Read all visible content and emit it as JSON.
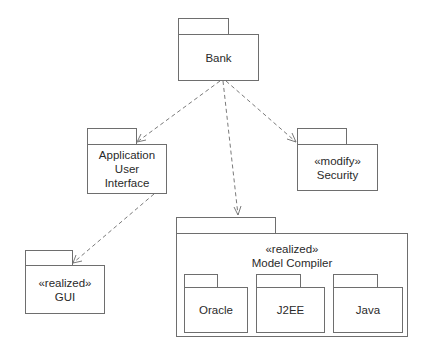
{
  "diagram": {
    "type": "UML package diagram",
    "packages": [
      {
        "id": "bank",
        "stereotype": "",
        "name_lines": [
          "Bank"
        ]
      },
      {
        "id": "app_ui",
        "stereotype": "",
        "name_lines": [
          "Application",
          "User",
          "Interface"
        ]
      },
      {
        "id": "security",
        "stereotype": "«modify»",
        "name_lines": [
          "Security"
        ]
      },
      {
        "id": "gui",
        "stereotype": "«realized»",
        "name_lines": [
          "GUI"
        ]
      },
      {
        "id": "model_compiler",
        "stereotype": "«realized»",
        "name_lines": [
          "Model Compiler"
        ],
        "children": [
          {
            "id": "oracle",
            "name": "Oracle"
          },
          {
            "id": "j2ee",
            "name": "J2EE"
          },
          {
            "id": "java",
            "name": "Java"
          }
        ]
      }
    ],
    "dependencies": [
      {
        "from": "bank",
        "to": "app_ui",
        "style": "dashed-open-arrow"
      },
      {
        "from": "bank",
        "to": "security",
        "style": "dashed-open-arrow"
      },
      {
        "from": "bank",
        "to": "model_compiler",
        "style": "dashed-open-arrow"
      },
      {
        "from": "app_ui",
        "to": "gui",
        "style": "dashed-open-arrow"
      }
    ],
    "colors": {
      "stroke": "#6e6e6e",
      "text": "#2a2a2a",
      "background": "#ffffff"
    }
  }
}
